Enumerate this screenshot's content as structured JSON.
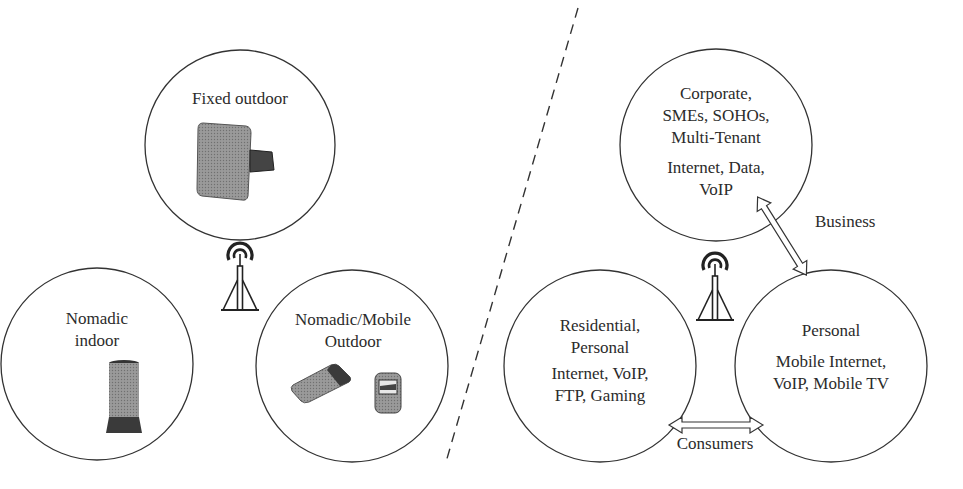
{
  "left_panel": {
    "circles": [
      {
        "id": "fixed-outdoor",
        "lines": [
          "Fixed outdoor"
        ],
        "device": "outdoor-cpe-antenna"
      },
      {
        "id": "nomadic-indoor",
        "lines": [
          "Nomadic",
          "indoor"
        ],
        "device": "indoor-desktop-modem"
      },
      {
        "id": "nomadic-mobile-outdoor",
        "lines": [
          "Nomadic/Mobile",
          "Outdoor"
        ],
        "devices": [
          "pc-card-modem",
          "pda-handheld"
        ]
      }
    ],
    "tower_icon": "radio-tower-icon"
  },
  "right_panel": {
    "circles": [
      {
        "id": "corporate",
        "segment_lines": [
          "Corporate,",
          "SMEs, SOHOs,",
          "Multi-Tenant"
        ],
        "service_lines": [
          "Internet, Data,",
          "VoIP"
        ]
      },
      {
        "id": "residential",
        "segment_lines": [
          "Residential,",
          "Personal"
        ],
        "service_lines": [
          "Internet, VoIP,",
          "FTP, Gaming"
        ]
      },
      {
        "id": "personal",
        "segment_lines": [
          "Personal"
        ],
        "service_lines": [
          "Mobile Internet,",
          "VoIP, Mobile TV"
        ]
      }
    ],
    "arrows": [
      {
        "id": "business-arrow",
        "label": "Business",
        "from": "corporate",
        "to": "personal"
      },
      {
        "id": "consumers-arrow",
        "label": "Consumers",
        "from": "residential",
        "to": "personal"
      }
    ],
    "tower_icon": "radio-tower-icon"
  },
  "divider": {
    "style": "dashed"
  },
  "colors": {
    "line": "#333333",
    "text": "#2b2b2b",
    "device_gray": "#8a8a8a",
    "device_dark": "#3a3a3a"
  }
}
